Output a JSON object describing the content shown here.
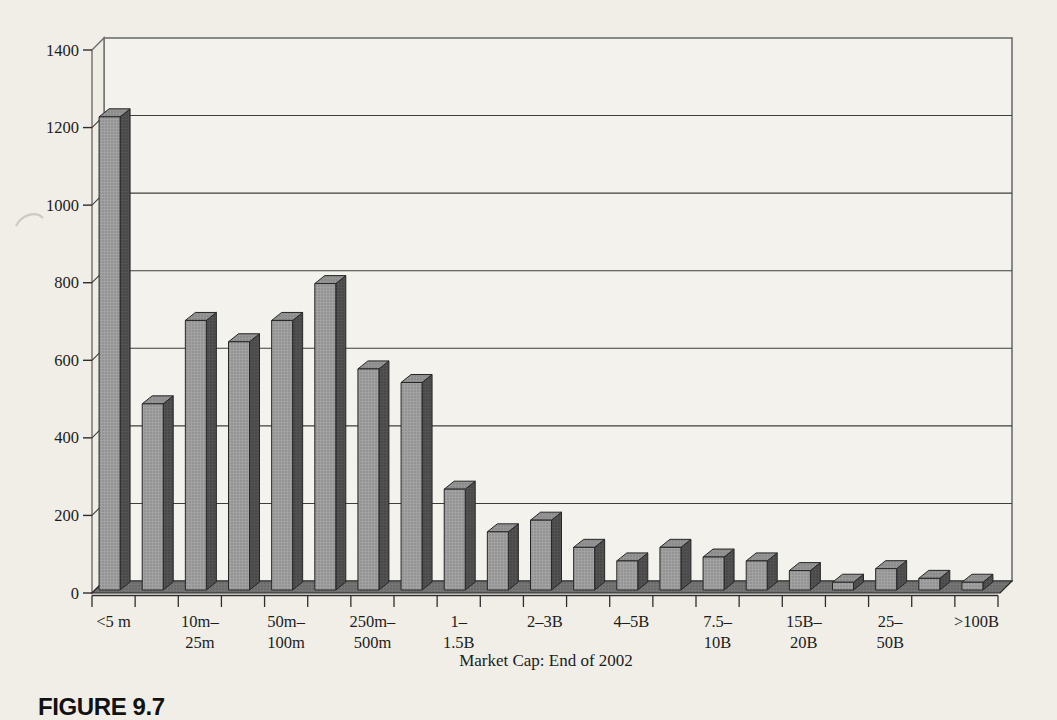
{
  "page": {
    "caption": "FIGURE 9.7"
  },
  "chart_data": {
    "type": "bar",
    "style": "3d-column-scanned-print",
    "title": "",
    "xlabel": "Market Cap: End of 2002",
    "ylabel": "",
    "ylim": [
      0,
      1400
    ],
    "y_ticks": [
      0,
      200,
      400,
      600,
      800,
      1000,
      1200,
      1400
    ],
    "grid": true,
    "legend": false,
    "categories": [
      "<5 m",
      "",
      "10m–\n25m",
      "",
      "50m–\n100m",
      "",
      "250m–\n500m",
      "",
      "1–\n1.5B",
      "",
      "2–3B",
      "",
      "4–5B",
      "",
      "7.5–\n10B",
      "",
      "15B–\n20B",
      "",
      "25–\n50B",
      "",
      ">100B"
    ],
    "values": [
      1220,
      480,
      695,
      640,
      695,
      790,
      570,
      535,
      260,
      150,
      180,
      110,
      75,
      110,
      85,
      75,
      50,
      20,
      55,
      30,
      20
    ],
    "colors": {
      "paper": "#f0eee7",
      "wall": "#f4f2ec",
      "left_wall": "#efece4",
      "wall_border": "#6e6e6e",
      "gridline": "#3e3e3e",
      "axis": "#2e2e2e",
      "outline": "#262626",
      "text": "#1c1c1c",
      "bar_front": "#a2a2a2",
      "bar_front_dot": "#7c7c7c",
      "bar_side": "#525252",
      "bar_side_dot": "#383838",
      "bar_top": "#969696",
      "bar_top_dot": "#787878",
      "floor": "#767676",
      "floor_dot": "#585858"
    }
  }
}
